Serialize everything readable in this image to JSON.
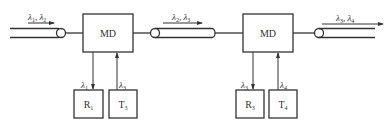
{
  "diagram": {
    "type": "wdm-add-drop-chain",
    "nodes": [
      {
        "id": "md1",
        "label": "MD"
      },
      {
        "id": "md2",
        "label": "MD"
      },
      {
        "id": "r1",
        "label": "R",
        "sub": "1"
      },
      {
        "id": "t3",
        "label": "T",
        "sub": "3"
      },
      {
        "id": "r3",
        "label": "R",
        "sub": "3"
      },
      {
        "id": "t4",
        "label": "T",
        "sub": "4"
      }
    ],
    "fibers": [
      {
        "id": "in",
        "lambdas": [
          {
            "sym": "λ",
            "sub": "1"
          },
          {
            "sym": "λ",
            "sub": "2"
          }
        ]
      },
      {
        "id": "mid",
        "lambdas": [
          {
            "sym": "λ",
            "sub": "2"
          },
          {
            "sym": "λ",
            "sub": "3"
          }
        ]
      },
      {
        "id": "out",
        "lambdas": [
          {
            "sym": "λ",
            "sub": "3"
          },
          {
            "sym": "λ",
            "sub": "4"
          }
        ]
      }
    ],
    "branches": [
      {
        "from": "md1",
        "to": "r1",
        "lambda": {
          "sym": "λ",
          "sub": "1"
        },
        "direction": "drop"
      },
      {
        "from": "t3",
        "to": "md1",
        "lambda": {
          "sym": "λ",
          "sub": "3"
        },
        "direction": "add"
      },
      {
        "from": "md2",
        "to": "r3",
        "lambda": {
          "sym": "λ",
          "sub": "3"
        },
        "direction": "drop"
      },
      {
        "from": "t4",
        "to": "md2",
        "lambda": {
          "sym": "λ",
          "sub": "4"
        },
        "direction": "add"
      }
    ],
    "separator": ", "
  }
}
